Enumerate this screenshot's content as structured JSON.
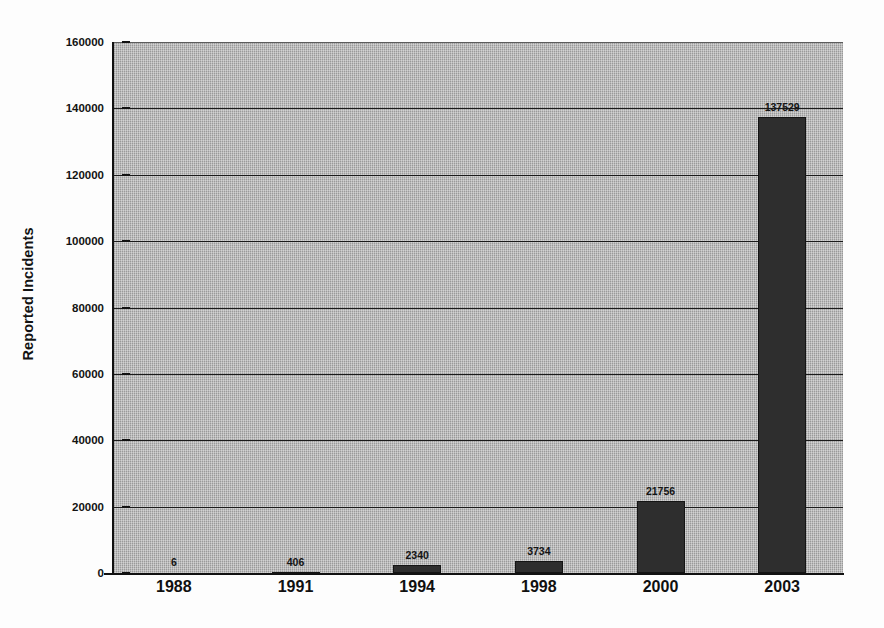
{
  "chart_data": {
    "type": "bar",
    "title": "",
    "xlabel": "",
    "ylabel": "Reported Incidents",
    "categories": [
      "1988",
      "1991",
      "1994",
      "1998",
      "2000",
      "2003"
    ],
    "values": [
      6,
      406,
      2340,
      3734,
      21756,
      137529
    ],
    "value_labels": [
      "6",
      "406",
      "2340",
      "3734",
      "21756",
      "137529"
    ],
    "ylim": [
      0,
      160000
    ],
    "ytick_values": [
      0,
      20000,
      40000,
      60000,
      80000,
      100000,
      120000,
      140000,
      160000
    ],
    "ytick_labels": [
      "0",
      "20000",
      "40000",
      "60000",
      "80000",
      "100000",
      "120000",
      "140000",
      "160000"
    ],
    "grid": true,
    "grid_axis": "y",
    "legend": false,
    "legend_position": "none",
    "bar_color": "#2e2e2e",
    "plot_background_color": "#a9a9a9",
    "figure_background_color": "#fdfdfd",
    "axis_color": "#111111",
    "gridline_color": "#1a1a1a"
  }
}
